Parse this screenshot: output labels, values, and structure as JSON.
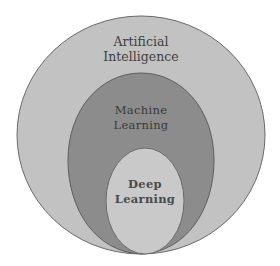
{
  "diagram": {
    "type": "nested-venn",
    "colors": {
      "outer_fill": "#c2c2c2",
      "middle_fill": "#8c8c8c",
      "inner_fill": "#c9c9c9",
      "stroke": "#6a6a6a"
    },
    "sets": [
      {
        "id": "ai",
        "line1": "Artificial",
        "line2": "Intelligence"
      },
      {
        "id": "ml",
        "line1": "Machine",
        "line2": "Learning"
      },
      {
        "id": "dl",
        "line1": "Deep",
        "line2": "Learning"
      }
    ]
  }
}
